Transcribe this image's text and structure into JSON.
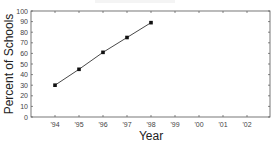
{
  "chart_data": {
    "type": "line",
    "title": "",
    "xlabel": "Year",
    "ylabel": "Percent of Schools",
    "categories": [
      "'94",
      "'95",
      "'96",
      "'97",
      "'98",
      "'99",
      "'00",
      "'01",
      "'02"
    ],
    "series": [
      {
        "name": "Percent of Schools",
        "values": [
          30,
          45,
          61,
          75,
          89,
          null,
          null,
          null,
          null
        ]
      }
    ],
    "ylim": [
      0,
      100
    ],
    "yticks": [
      0,
      10,
      20,
      30,
      40,
      50,
      60,
      70,
      80,
      90,
      100
    ],
    "grid": false,
    "legend": null,
    "colors": {
      "line": "#333333",
      "marker": "#111111",
      "frame": "#555555"
    }
  }
}
